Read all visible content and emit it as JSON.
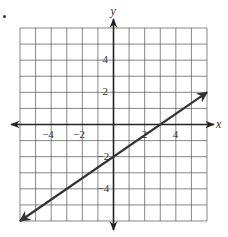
{
  "chart_data": {
    "type": "line",
    "title": "",
    "xlabel": "x",
    "ylabel": "y",
    "xlim": [
      -6,
      6
    ],
    "ylim": [
      -6,
      6
    ],
    "grid": true,
    "grid_step": 1,
    "x_ticks": [
      -4,
      -2,
      2,
      4
    ],
    "y_ticks": [
      4,
      2,
      -2,
      -4
    ],
    "x_tick_labels": [
      "−4",
      "−2",
      "2",
      "4"
    ],
    "y_tick_labels": [
      "4",
      "2",
      "−2",
      "−4"
    ],
    "series": [
      {
        "name": "line",
        "equation": "y = (2/3)x - 2",
        "slope": 0.6667,
        "y_intercept": -2,
        "x_intercept": 3,
        "x": [
          -6,
          6
        ],
        "y": [
          -6,
          2
        ],
        "arrows_both_ends": true
      }
    ],
    "colors": {
      "grid": "#555555",
      "axis": "#222222",
      "line": "#333333"
    }
  }
}
